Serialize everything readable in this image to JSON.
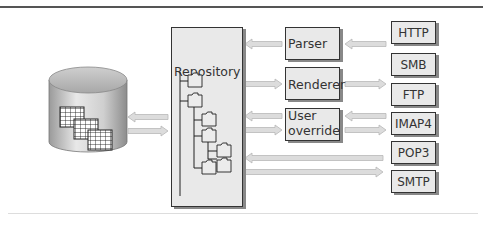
{
  "diagram": {
    "database": {
      "label": ""
    },
    "repository": {
      "label": "Repository"
    },
    "processors": [
      {
        "label": "Parser"
      },
      {
        "label": "Renderer"
      },
      {
        "label": "User override",
        "line1": "User",
        "line2": "override"
      }
    ],
    "protocols": [
      {
        "label": "HTTP"
      },
      {
        "label": "SMB"
      },
      {
        "label": "FTP"
      },
      {
        "label": "IMAP4"
      },
      {
        "label": "POP3"
      },
      {
        "label": "SMTP"
      }
    ],
    "colors": {
      "box_fill": "#e9e9e9",
      "box_border": "#333333",
      "arrow_fill": "#dcdcdc",
      "arrow_border": "#b8b8b8"
    }
  }
}
